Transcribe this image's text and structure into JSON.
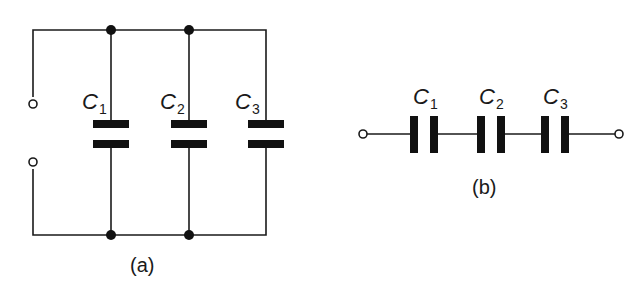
{
  "figure": {
    "parallel": {
      "caption": "(a)",
      "capacitors": [
        {
          "label": "C",
          "subscript": "1"
        },
        {
          "label": "C",
          "subscript": "2"
        },
        {
          "label": "C",
          "subscript": "3"
        }
      ]
    },
    "series": {
      "caption": "(b)",
      "capacitors": [
        {
          "label": "C",
          "subscript": "1"
        },
        {
          "label": "C",
          "subscript": "2"
        },
        {
          "label": "C",
          "subscript": "3"
        }
      ]
    }
  }
}
